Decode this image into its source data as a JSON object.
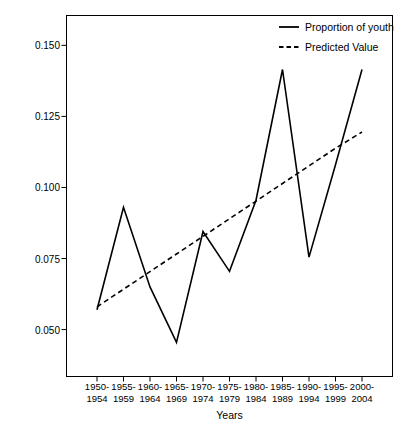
{
  "chart_data": {
    "type": "line",
    "title": "",
    "xlabel": "Years",
    "ylabel": "Mean representation of young characters",
    "categories": [
      "1950–\n1954",
      "1955–\n1959",
      "1960–\n1964",
      "1965–\n1969",
      "1970–\n1974",
      "1975–\n1979",
      "1980–\n1984",
      "1985–\n1989",
      "1990–\n1994",
      "1995–\n1999",
      "2000–\n2004"
    ],
    "category_lines": [
      [
        "1950-",
        "1954"
      ],
      [
        "1955-",
        "1959"
      ],
      [
        "1960-",
        "1964"
      ],
      [
        "1965-",
        "1969"
      ],
      [
        "1970-",
        "1974"
      ],
      [
        "1975-",
        "1979"
      ],
      [
        "1980-",
        "1984"
      ],
      [
        "1985-",
        "1989"
      ],
      [
        "1990-",
        "1994"
      ],
      [
        "1995-",
        "1999"
      ],
      [
        "2000-",
        "2004"
      ]
    ],
    "series": [
      {
        "name": "Proportion of youth",
        "style": "solid",
        "color": "#000000",
        "values": [
          0.057,
          0.093,
          0.065,
          0.0455,
          0.0845,
          0.0705,
          0.0955,
          0.1415,
          0.0755,
          0.108,
          0.1415
        ]
      },
      {
        "name": "Predicted Value",
        "style": "dashed",
        "color": "#000000",
        "values": [
          0.058,
          0.0642,
          0.0704,
          0.0766,
          0.0828,
          0.089,
          0.0952,
          0.1014,
          0.1076,
          0.1138,
          0.1195
        ]
      }
    ],
    "ylim": [
      0.0335,
      0.1605
    ],
    "yticks": [
      0.05,
      0.075,
      0.1,
      0.125,
      0.15
    ],
    "ytick_labels": [
      "0.050",
      "0.075",
      "0.100",
      "0.125",
      "0.150"
    ],
    "grid": false,
    "legend_position": "top-right",
    "frame": true
  },
  "legend": {
    "items": [
      {
        "label": "Proportion of youth",
        "style": "solid"
      },
      {
        "label": "Predicted Value",
        "style": "dashed"
      }
    ]
  },
  "axes": {
    "x_title": "Years",
    "y_title": "Mean representation of young characters"
  }
}
